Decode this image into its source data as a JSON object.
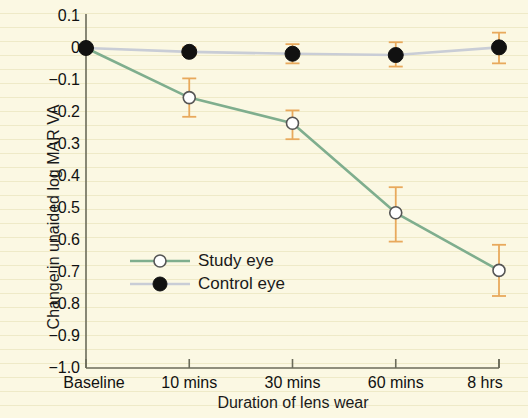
{
  "chart_data": {
    "type": "line",
    "title": "",
    "xlabel": "Duration of lens wear",
    "ylabel": "Change in unaided log MAR VA",
    "categories": [
      "Baseline",
      "10 mins",
      "30 mins",
      "60 mins",
      "8 hrs"
    ],
    "ylim": [
      -1.0,
      0.1
    ],
    "ytick_labels": [
      "0.1",
      "0",
      "−0.1",
      "−0.2",
      "−0.3",
      "−0.4",
      "−0.5",
      "−0.6",
      "−0.7",
      "−0.8",
      "−0.9",
      "−1.0"
    ],
    "ytick_values": [
      0.1,
      0,
      -0.1,
      -0.2,
      -0.3,
      -0.4,
      -0.5,
      -0.6,
      -0.7,
      -0.8,
      -0.9,
      -1.0
    ],
    "grid": false,
    "legend_position": "inside-lower-left",
    "series": [
      {
        "name": "Study eye",
        "marker": "open-circle",
        "line_color": "#7fae8e",
        "marker_face": "#ffffff",
        "marker_edge": "#555555",
        "errorbar_color": "#e8a95c",
        "values": [
          0.0,
          -0.155,
          -0.235,
          -0.515,
          -0.695
        ],
        "err_low": [
          0.0,
          -0.215,
          -0.285,
          -0.605,
          -0.775
        ],
        "err_high": [
          0.0,
          -0.095,
          -0.195,
          -0.435,
          -0.615
        ]
      },
      {
        "name": "Control eye",
        "marker": "filled-circle",
        "line_color": "#c9cdd6",
        "marker_face": "#111111",
        "marker_edge": "#111111",
        "errorbar_color": "#e8a95c",
        "values": [
          0.0,
          -0.012,
          -0.018,
          -0.022,
          0.002
        ],
        "err_low": [
          0.0,
          -0.022,
          -0.048,
          -0.058,
          -0.048
        ],
        "err_high": [
          0.0,
          0.002,
          0.012,
          0.018,
          0.048
        ]
      }
    ]
  },
  "legend": {
    "entries": [
      {
        "label": "Study eye"
      },
      {
        "label": "Control eye"
      }
    ]
  }
}
